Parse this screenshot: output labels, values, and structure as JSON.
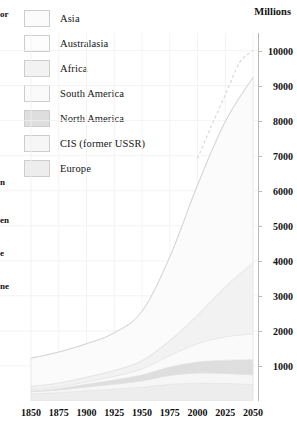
{
  "axis_title": "Millions",
  "legend": {
    "items": [
      {
        "label": "Asia",
        "color": "#fbfbfb"
      },
      {
        "label": "Australasia",
        "color": "#fdfdfd"
      },
      {
        "label": "Africa",
        "color": "#f2f2f2"
      },
      {
        "label": "South America",
        "color": "#fafafa"
      },
      {
        "label": "North America",
        "color": "#dedede"
      },
      {
        "label": "CIS (former USSR)",
        "color": "#f6f6f6"
      },
      {
        "label": "Europe",
        "color": "#ededed"
      }
    ]
  },
  "edge_fragments": [
    {
      "text": "or",
      "top": 9
    },
    {
      "text": "n",
      "top": 177
    },
    {
      "text": "en",
      "top": 215
    },
    {
      "text": "e",
      "top": 248
    },
    {
      "text": "ne",
      "top": 281
    }
  ],
  "chart_data": {
    "type": "area",
    "title": "",
    "subtitle": "",
    "xlabel": "",
    "ylabel": "Millions",
    "stacked": true,
    "grid": true,
    "legend_position": "top-left",
    "xlim": [
      1850,
      2050
    ],
    "ylim": [
      0,
      10500
    ],
    "xticks": [
      1850,
      1875,
      1900,
      1925,
      1950,
      1975,
      2000,
      2025,
      2050
    ],
    "yticks": [
      1000,
      2000,
      3000,
      4000,
      5000,
      6000,
      7000,
      8000,
      9000,
      10000
    ],
    "x": [
      1850,
      1875,
      1900,
      1925,
      1950,
      1975,
      2000,
      2025,
      2050
    ],
    "series": [
      {
        "name": "Europe",
        "color": "#ededed",
        "values": [
          205,
          240,
          290,
          340,
          395,
          475,
          510,
          500,
          470
        ]
      },
      {
        "name": "CIS (former USSR)",
        "color": "#f6f6f6",
        "values": [
          60,
          75,
          110,
          140,
          180,
          255,
          290,
          285,
          275
        ]
      },
      {
        "name": "North America",
        "color": "#dedede",
        "values": [
          26,
          45,
          82,
          125,
          172,
          243,
          314,
          380,
          435
        ]
      },
      {
        "name": "South America",
        "color": "#fafafa",
        "values": [
          33,
          44,
          63,
          95,
          167,
          322,
          520,
          665,
          735
        ]
      },
      {
        "name": "Africa",
        "color": "#f2f2f2",
        "values": [
          95,
          110,
          133,
          165,
          229,
          416,
          796,
          1400,
          2000
        ]
      },
      {
        "name": "Australasia",
        "color": "#fdfdfd",
        "values": [
          2,
          3,
          6,
          10,
          13,
          21,
          31,
          41,
          48
        ]
      },
      {
        "name": "Asia",
        "color": "#fbfbfb",
        "values": [
          800,
          880,
          950,
          1070,
          1402,
          2379,
          3698,
          4700,
          5270
        ]
      }
    ],
    "projection": {
      "label": "projection",
      "style": "dashed",
      "x": [
        2000,
        2012,
        2025,
        2038,
        2050
      ],
      "y": [
        6159,
        7050,
        7971,
        8900,
        9233
      ]
    },
    "totals": [
      1221,
      1397,
      1634,
      1945,
      2558,
      4111,
      6159,
      7971,
      9233
    ]
  }
}
